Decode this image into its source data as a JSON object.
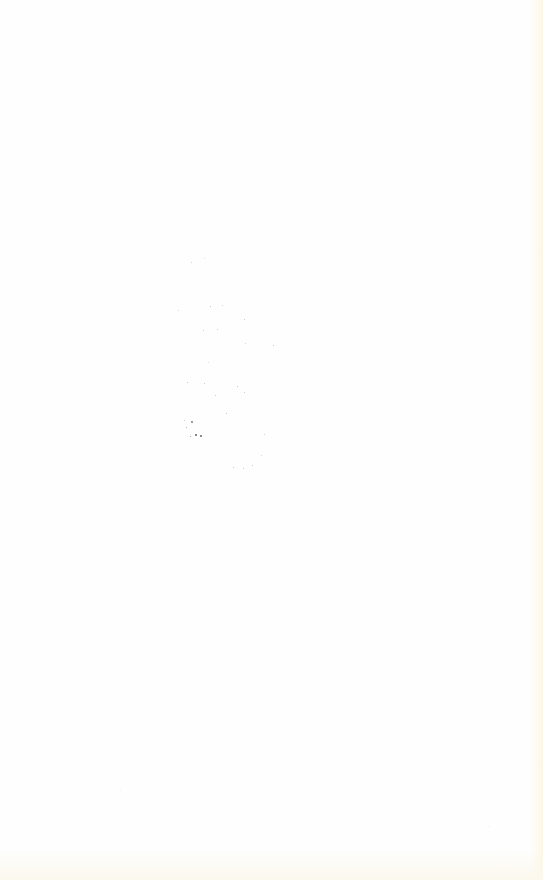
{
  "page": {
    "background": "#fefefe",
    "edge_tint": "#fbf6e6",
    "content": ""
  },
  "specks": [
    {
      "x": 191,
      "y": 262,
      "s": 1.2,
      "o": 0.25
    },
    {
      "x": 204,
      "y": 258,
      "s": 1.0,
      "o": 0.2
    },
    {
      "x": 178,
      "y": 310,
      "s": 1.0,
      "o": 0.25
    },
    {
      "x": 210,
      "y": 306,
      "s": 1.2,
      "o": 0.35
    },
    {
      "x": 222,
      "y": 305,
      "s": 1.0,
      "o": 0.25
    },
    {
      "x": 244,
      "y": 319,
      "s": 1.0,
      "o": 0.3
    },
    {
      "x": 203,
      "y": 330,
      "s": 1.2,
      "o": 0.3
    },
    {
      "x": 217,
      "y": 329,
      "s": 1.0,
      "o": 0.3
    },
    {
      "x": 245,
      "y": 343,
      "s": 1.0,
      "o": 0.25
    },
    {
      "x": 273,
      "y": 345,
      "s": 1.0,
      "o": 0.35
    },
    {
      "x": 208,
      "y": 362,
      "s": 1.0,
      "o": 0.2
    },
    {
      "x": 187,
      "y": 382,
      "s": 1.2,
      "o": 0.35
    },
    {
      "x": 204,
      "y": 383,
      "s": 1.0,
      "o": 0.3
    },
    {
      "x": 237,
      "y": 386,
      "s": 1.2,
      "o": 0.35
    },
    {
      "x": 244,
      "y": 392,
      "s": 1.0,
      "o": 0.3
    },
    {
      "x": 215,
      "y": 395,
      "s": 1.0,
      "o": 0.3
    },
    {
      "x": 226,
      "y": 413,
      "s": 1.2,
      "o": 0.35
    },
    {
      "x": 184,
      "y": 420,
      "s": 1.0,
      "o": 0.3
    },
    {
      "x": 191,
      "y": 421,
      "s": 1.5,
      "o": 0.55
    },
    {
      "x": 186,
      "y": 427,
      "s": 1.2,
      "o": 0.45
    },
    {
      "x": 195,
      "y": 434,
      "s": 2.0,
      "o": 0.75
    },
    {
      "x": 200,
      "y": 435,
      "s": 1.8,
      "o": 0.7
    },
    {
      "x": 190,
      "y": 436,
      "s": 1.2,
      "o": 0.5
    },
    {
      "x": 264,
      "y": 434,
      "s": 1.0,
      "o": 0.25
    },
    {
      "x": 233,
      "y": 467,
      "s": 1.0,
      "o": 0.3
    },
    {
      "x": 243,
      "y": 468,
      "s": 1.0,
      "o": 0.3
    },
    {
      "x": 252,
      "y": 465,
      "s": 1.0,
      "o": 0.3
    },
    {
      "x": 261,
      "y": 455,
      "s": 1.0,
      "o": 0.25
    },
    {
      "x": 120,
      "y": 790,
      "s": 1.0,
      "o": 0.08
    },
    {
      "x": 470,
      "y": 860,
      "s": 1.0,
      "o": 0.12
    },
    {
      "x": 488,
      "y": 826,
      "s": 1.0,
      "o": 0.1
    }
  ]
}
